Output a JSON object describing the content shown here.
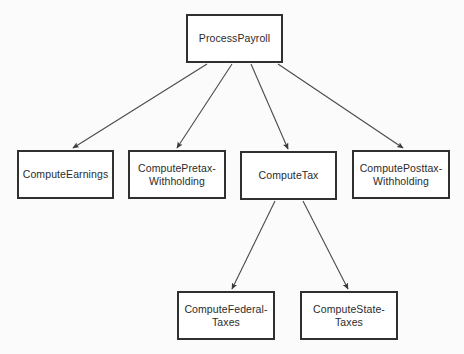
{
  "diagram": {
    "type": "call-hierarchy-tree",
    "background_color": "#fbfbfb",
    "node_fill": "#ffffff",
    "node_border_color": "#303030",
    "edge_color": "#4a4a4a",
    "nodes": [
      {
        "id": "process-payroll",
        "label": "ProcessPayroll",
        "x": 186,
        "y": 14,
        "w": 97,
        "h": 49
      },
      {
        "id": "compute-earnings",
        "label": "ComputeEarnings",
        "x": 17,
        "y": 150,
        "w": 97,
        "h": 49
      },
      {
        "id": "compute-pretax",
        "label": "ComputePretax-\nWithholding",
        "x": 128,
        "y": 150,
        "w": 98,
        "h": 49
      },
      {
        "id": "compute-tax",
        "label": "ComputeTax",
        "x": 240,
        "y": 151,
        "w": 97,
        "h": 49
      },
      {
        "id": "compute-posttax",
        "label": "ComputePosttax-\nWithholding",
        "x": 352,
        "y": 150,
        "w": 98,
        "h": 49
      },
      {
        "id": "compute-federal-taxes",
        "label": "ComputeFederal-\nTaxes",
        "x": 177,
        "y": 291,
        "w": 98,
        "h": 49
      },
      {
        "id": "compute-state-taxes",
        "label": "ComputeState-\nTaxes",
        "x": 300,
        "y": 291,
        "w": 98,
        "h": 49
      }
    ],
    "edges": [
      {
        "from": "process-payroll",
        "to": "compute-earnings",
        "x1": 207,
        "y1": 64,
        "x2": 73,
        "y2": 148
      },
      {
        "from": "process-payroll",
        "to": "compute-pretax",
        "x1": 232,
        "y1": 64,
        "x2": 177,
        "y2": 148
      },
      {
        "from": "process-payroll",
        "to": "compute-tax",
        "x1": 251,
        "y1": 64,
        "x2": 288,
        "y2": 149
      },
      {
        "from": "process-payroll",
        "to": "compute-posttax",
        "x1": 278,
        "y1": 64,
        "x2": 403,
        "y2": 148
      },
      {
        "from": "compute-tax",
        "to": "compute-federal-taxes",
        "x1": 275,
        "y1": 201,
        "x2": 232,
        "y2": 289
      },
      {
        "from": "compute-tax",
        "to": "compute-state-taxes",
        "x1": 303,
        "y1": 201,
        "x2": 348,
        "y2": 289
      }
    ]
  }
}
